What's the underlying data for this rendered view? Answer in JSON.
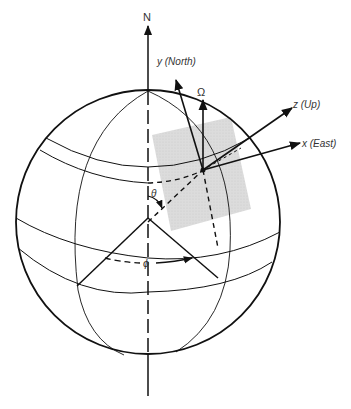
{
  "diagram": {
    "labels": {
      "north_pole": "N",
      "y_axis": "y (North)",
      "z_axis": "z (Up)",
      "x_axis": "x (East)",
      "earth_rate": "Ω",
      "colatitude": "θ",
      "longitude": "ϕ"
    },
    "colors": {
      "stroke": "#111111",
      "tangent_plane": "#d9d9d9",
      "text": "#333333",
      "background": "#ffffff"
    },
    "geometry": {
      "sphere": {
        "cx": 148,
        "cy": 222,
        "r": 132
      },
      "polar_axis": {
        "x": 148,
        "y_top": 22,
        "y_bottom": 396
      },
      "point_P": {
        "x": 203,
        "y": 170
      }
    },
    "elements": [
      "sphere-outline",
      "polar-axis",
      "equator",
      "latitude-circles",
      "meridians",
      "tangent-plane",
      "local-axes",
      "earth-rate-vector",
      "colatitude-angle",
      "longitude-angle"
    ]
  }
}
